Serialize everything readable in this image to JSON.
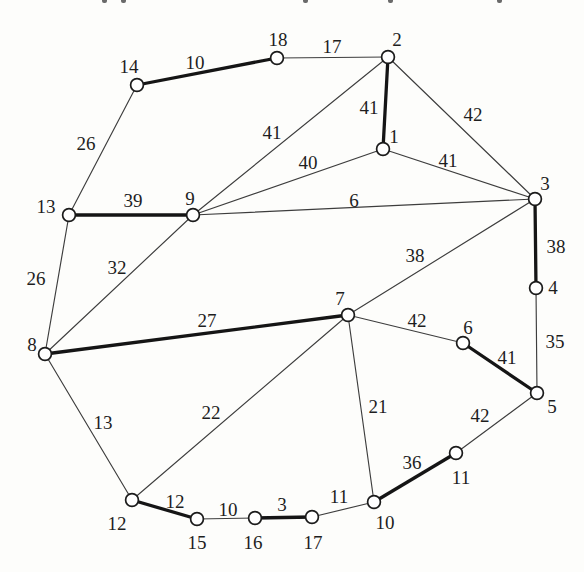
{
  "page": {
    "top_edge_fragments": [
      {
        "x": 102
      },
      {
        "x": 121
      },
      {
        "x": 303
      },
      {
        "x": 388
      },
      {
        "x": 497
      }
    ]
  },
  "colors": {
    "background": "#fdfdfb",
    "edge_thin": "#3d3d3d",
    "edge_bold": "#151515",
    "node_fill": "#ffffff",
    "node_stroke": "#1b1b1b",
    "label": "#1e1e1e"
  },
  "chart_data": {
    "type": "graph",
    "title": "",
    "layout": "node-link diagram with weighted edges; bold edges form a perfect matching",
    "nodes": [
      {
        "id": "1",
        "x": 383,
        "y": 149,
        "lx": 394,
        "ly": 136
      },
      {
        "id": "2",
        "x": 388,
        "y": 57,
        "lx": 397,
        "ly": 39
      },
      {
        "id": "3",
        "x": 535,
        "y": 199,
        "lx": 545,
        "ly": 183
      },
      {
        "id": "4",
        "x": 536,
        "y": 288,
        "lx": 553,
        "ly": 287
      },
      {
        "id": "5",
        "x": 537,
        "y": 393,
        "lx": 552,
        "ly": 406
      },
      {
        "id": "6",
        "x": 463,
        "y": 343,
        "lx": 468,
        "ly": 327
      },
      {
        "id": "7",
        "x": 348,
        "y": 315,
        "lx": 340,
        "ly": 298
      },
      {
        "id": "8",
        "x": 45,
        "y": 354,
        "lx": 32,
        "ly": 344
      },
      {
        "id": "9",
        "x": 193,
        "y": 215,
        "lx": 190,
        "ly": 198
      },
      {
        "id": "10",
        "x": 374,
        "y": 502,
        "lx": 385,
        "ly": 522
      },
      {
        "id": "11",
        "x": 456,
        "y": 453,
        "lx": 461,
        "ly": 477
      },
      {
        "id": "12",
        "x": 132,
        "y": 500,
        "lx": 117,
        "ly": 523
      },
      {
        "id": "13",
        "x": 69,
        "y": 215,
        "lx": 46,
        "ly": 206
      },
      {
        "id": "14",
        "x": 137,
        "y": 85,
        "lx": 129,
        "ly": 66
      },
      {
        "id": "15",
        "x": 197,
        "y": 519,
        "lx": 197,
        "ly": 542
      },
      {
        "id": "16",
        "x": 255,
        "y": 518,
        "lx": 253,
        "ly": 542
      },
      {
        "id": "17",
        "x": 312,
        "y": 517,
        "lx": 313,
        "ly": 542
      },
      {
        "id": "18",
        "x": 277,
        "y": 58,
        "lx": 278,
        "ly": 39
      }
    ],
    "edges": [
      {
        "from": "14",
        "to": "18",
        "weight": 10,
        "bold": true,
        "lx": 195,
        "ly": 62
      },
      {
        "from": "18",
        "to": "2",
        "weight": 17,
        "bold": false,
        "lx": 332,
        "ly": 46
      },
      {
        "from": "2",
        "to": "1",
        "weight": 41,
        "bold": true,
        "lx": 369,
        "ly": 107
      },
      {
        "from": "2",
        "to": "3",
        "weight": 42,
        "bold": false,
        "lx": 473,
        "ly": 114
      },
      {
        "from": "9",
        "to": "2",
        "weight": 41,
        "bold": false,
        "lx": 272,
        "ly": 132
      },
      {
        "from": "9",
        "to": "1",
        "weight": 40,
        "bold": false,
        "lx": 308,
        "ly": 162
      },
      {
        "from": "1",
        "to": "3",
        "weight": 41,
        "bold": false,
        "lx": 448,
        "ly": 160
      },
      {
        "from": "9",
        "to": "3",
        "weight": 6,
        "bold": false,
        "lx": 354,
        "ly": 200
      },
      {
        "from": "13",
        "to": "14",
        "weight": 26,
        "bold": false,
        "lx": 86,
        "ly": 143
      },
      {
        "from": "13",
        "to": "9",
        "weight": 39,
        "bold": true,
        "lx": 133,
        "ly": 200
      },
      {
        "from": "13",
        "to": "8",
        "weight": 26,
        "bold": false,
        "lx": 36,
        "ly": 278
      },
      {
        "from": "8",
        "to": "9",
        "weight": 32,
        "bold": false,
        "lx": 117,
        "ly": 267
      },
      {
        "from": "3",
        "to": "4",
        "weight": 38,
        "bold": true,
        "lx": 556,
        "ly": 246
      },
      {
        "from": "3",
        "to": "7",
        "weight": 38,
        "bold": false,
        "lx": 415,
        "ly": 255
      },
      {
        "from": "4",
        "to": "5",
        "weight": 35,
        "bold": false,
        "lx": 555,
        "ly": 341
      },
      {
        "from": "8",
        "to": "7",
        "weight": 27,
        "bold": true,
        "lx": 207,
        "ly": 320
      },
      {
        "from": "7",
        "to": "6",
        "weight": 42,
        "bold": false,
        "lx": 417,
        "ly": 320
      },
      {
        "from": "6",
        "to": "5",
        "weight": 41,
        "bold": true,
        "lx": 507,
        "ly": 357
      },
      {
        "from": "5",
        "to": "11",
        "weight": 42,
        "bold": false,
        "lx": 480,
        "ly": 415
      },
      {
        "from": "11",
        "to": "10",
        "weight": 36,
        "bold": true,
        "lx": 412,
        "ly": 462
      },
      {
        "from": "7",
        "to": "10",
        "weight": 21,
        "bold": false,
        "lx": 378,
        "ly": 406
      },
      {
        "from": "7",
        "to": "12",
        "weight": 22,
        "bold": false,
        "lx": 211,
        "ly": 412
      },
      {
        "from": "8",
        "to": "12",
        "weight": 13,
        "bold": false,
        "lx": 103,
        "ly": 422
      },
      {
        "from": "12",
        "to": "15",
        "weight": 12,
        "bold": true,
        "lx": 175,
        "ly": 501
      },
      {
        "from": "15",
        "to": "16",
        "weight": 10,
        "bold": false,
        "lx": 228,
        "ly": 509
      },
      {
        "from": "16",
        "to": "17",
        "weight": 3,
        "bold": true,
        "lx": 282,
        "ly": 504
      },
      {
        "from": "17",
        "to": "10",
        "weight": 11,
        "bold": false,
        "lx": 339,
        "ly": 496
      }
    ],
    "node_radius": 6.4,
    "canvas": {
      "width": 584,
      "height": 572
    }
  }
}
